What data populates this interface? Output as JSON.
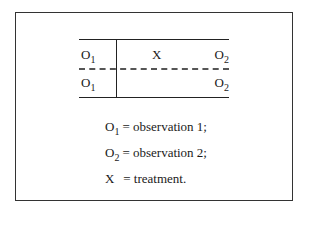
{
  "diagram": {
    "type": "quasi-experimental design notation",
    "rows": [
      {
        "pretest": {
          "letter": "O",
          "subscript": "1"
        },
        "treatment": "X",
        "posttest": {
          "letter": "O",
          "subscript": "2"
        }
      },
      {
        "pretest": {
          "letter": "O",
          "subscript": "1"
        },
        "treatment": "",
        "posttest": {
          "letter": "O",
          "subscript": "2"
        }
      }
    ],
    "row_separator": "dashed"
  },
  "legend": [
    {
      "symbol": "O",
      "subscript": "1",
      "text": "= observation 1;"
    },
    {
      "symbol": "O",
      "subscript": "2",
      "text": "= observation 2;"
    },
    {
      "symbol": "X",
      "subscript": "",
      "text": " = treatment."
    }
  ],
  "colors": {
    "frame": "#333333",
    "lines": "#222222",
    "dashed": "#555555",
    "text": "#1a1a1a",
    "background": "#ffffff"
  }
}
